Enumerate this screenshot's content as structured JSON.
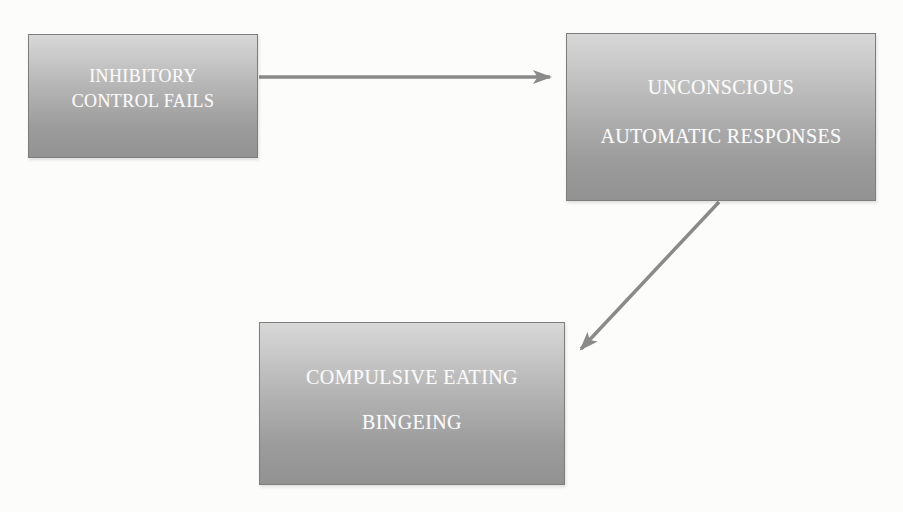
{
  "canvas": {
    "width": 903,
    "height": 512,
    "background": "#fcfcfb"
  },
  "colors": {
    "arrow": "#8a8a8a",
    "box_border": "#7d7d7d",
    "box_gradient_top": "#d8d8d8",
    "box_gradient_bottom": "#929292",
    "text": "#fafafa"
  },
  "boxes": [
    {
      "name": "inhibitory-control-fails",
      "lines": [
        "INHIBITORY",
        "CONTROL FAILS"
      ]
    },
    {
      "name": "unconscious-automatic-responses",
      "lines": [
        "UNCONSCIOUS",
        "AUTOMATIC RESPONSES"
      ]
    },
    {
      "name": "compulsive-eating-bingeing",
      "lines": [
        "COMPULSIVE EATING",
        "BINGEING"
      ]
    }
  ],
  "arrows": [
    {
      "name": "arrow-inhibitory-to-unconscious",
      "from": "inhibitory-control-fails",
      "to": "unconscious-automatic-responses"
    },
    {
      "name": "arrow-unconscious-to-compulsive",
      "from": "unconscious-automatic-responses",
      "to": "compulsive-eating-bingeing"
    }
  ]
}
